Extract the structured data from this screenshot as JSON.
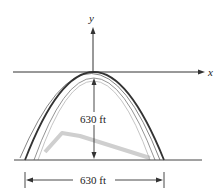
{
  "diagram": {
    "axes": {
      "x_label": "x",
      "y_label": "y"
    },
    "height_label": "630 ft",
    "width_label": "630 ft",
    "colors": {
      "arch": "#3a3a3a",
      "shadow": "#c8c8c8",
      "axis": "#333333"
    }
  }
}
